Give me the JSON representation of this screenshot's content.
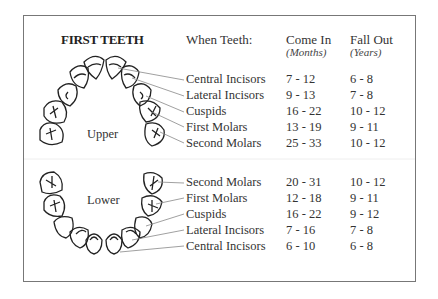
{
  "title": "FIRST TEETH",
  "headers": {
    "teeth": "When Teeth:",
    "come_in": "Come In",
    "come_in_unit": "(Months)",
    "fall_out": "Fall Out",
    "fall_out_unit": "(Years)"
  },
  "upper": {
    "label": "Upper",
    "rows": [
      {
        "name": "Central Incisors",
        "come_in": "7 - 12",
        "fall_out": "6 - 8"
      },
      {
        "name": "Lateral Incisors",
        "come_in": "9 - 13",
        "fall_out": "7 - 8"
      },
      {
        "name": "Cuspids",
        "come_in": "16 - 22",
        "fall_out": "10 - 12"
      },
      {
        "name": "First Molars",
        "come_in": "13 - 19",
        "fall_out": "9 - 11"
      },
      {
        "name": "Second Molars",
        "come_in": "25 - 33",
        "fall_out": "10 - 12"
      }
    ]
  },
  "lower": {
    "label": "Lower",
    "rows": [
      {
        "name": "Second Molars",
        "come_in": "20 - 31",
        "fall_out": "10 - 12"
      },
      {
        "name": "First Molars",
        "come_in": "12 - 18",
        "fall_out": "9 - 11"
      },
      {
        "name": "Cuspids",
        "come_in": "16 - 22",
        "fall_out": "9 - 12"
      },
      {
        "name": "Lateral Incisors",
        "come_in": "7 - 16",
        "fall_out": "7 - 8"
      },
      {
        "name": "Central Incisors",
        "come_in": "6 - 10",
        "fall_out": "6 - 8"
      }
    ]
  }
}
